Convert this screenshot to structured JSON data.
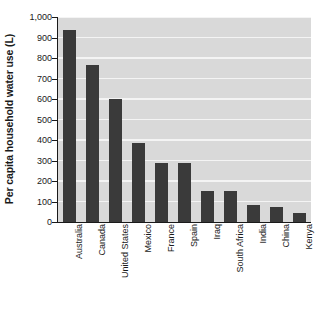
{
  "chart_data": {
    "type": "bar",
    "title": "",
    "xlabel": "",
    "ylabel": "Per capita household water use (L)",
    "ylim": [
      0,
      1000
    ],
    "ytick_labels": [
      "1,000",
      "900",
      "800",
      "700",
      "600",
      "500",
      "400",
      "300",
      "200",
      "100",
      "0"
    ],
    "ytick_values": [
      1000,
      900,
      800,
      700,
      600,
      500,
      400,
      300,
      200,
      100,
      0
    ],
    "grid": true,
    "legend": "none",
    "orientation": "vertical",
    "categories": [
      "Australia",
      "Canada",
      "United States",
      "Mexico",
      "France",
      "Spain",
      "Iraq",
      "South Africa",
      "India",
      "China",
      "Kenya"
    ],
    "values": [
      935,
      765,
      600,
      385,
      288,
      287,
      150,
      150,
      85,
      72,
      43
    ],
    "bars": [
      {
        "category": "Australia",
        "value": 935
      },
      {
        "category": "Canada",
        "value": 765
      },
      {
        "category": "United States",
        "value": 600
      },
      {
        "category": "Mexico",
        "value": 385
      },
      {
        "category": "France",
        "value": 288
      },
      {
        "category": "Spain",
        "value": 287
      },
      {
        "category": "Iraq",
        "value": 150
      },
      {
        "category": "South Africa",
        "value": 150
      },
      {
        "category": "India",
        "value": 85
      },
      {
        "category": "China",
        "value": 72
      },
      {
        "category": "Kenya",
        "value": 43
      }
    ],
    "colors": {
      "bar": "#3a3a3a",
      "plot_background": "#d9d9d9",
      "gridline": "#f4f4f4",
      "axis": "#1a1a1a",
      "page_background": "#ffffff",
      "text": "#1a1a1a"
    }
  }
}
